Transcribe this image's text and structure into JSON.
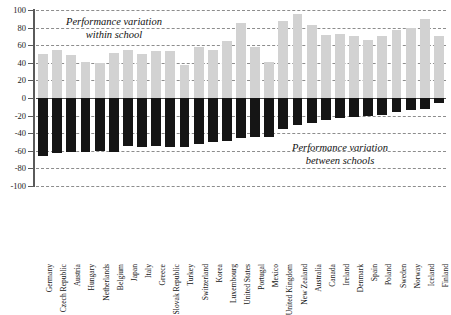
{
  "chart_data": {
    "type": "bar",
    "title": "",
    "subtitle": "",
    "xlabel": "",
    "ylabel": "",
    "ylim": [
      -100,
      100
    ],
    "yticks": [
      100,
      80,
      60,
      40,
      20,
      0,
      -20,
      -40,
      -60,
      -80,
      -100
    ],
    "ytick_labels": [
      "100",
      "80",
      "60",
      "40",
      "20",
      "0",
      "-20",
      "-40",
      "-60",
      "-80",
      "-100"
    ],
    "grid": true,
    "legend_position": "none",
    "stacked": true,
    "annotations": [
      {
        "id": "within",
        "text_line1": "Performance variation",
        "text_line2": "within school"
      },
      {
        "id": "between",
        "text_line1": "Performance variation",
        "text_line2": "between schools"
      }
    ],
    "series": [
      {
        "name": "Performance variation within school",
        "color": "#d2d2d2",
        "values": [
          50,
          55,
          49,
          41,
          40,
          51,
          55,
          50,
          53,
          53,
          38,
          58,
          55,
          65,
          85,
          58,
          41,
          88,
          95,
          83,
          72,
          73,
          70,
          66,
          71,
          77,
          80,
          90,
          70
        ]
      },
      {
        "name": "Performance variation between schools",
        "color": "#151515",
        "values": [
          -66,
          -63,
          -61,
          -61,
          -60,
          -61,
          -55,
          -56,
          -55,
          -56,
          -56,
          -52,
          -50,
          -49,
          -45,
          -44,
          -44,
          -35,
          -31,
          -28,
          -25,
          -23,
          -22,
          -21,
          -19,
          -16,
          -14,
          -12,
          -6
        ]
      }
    ],
    "categories": [
      "Germany",
      "Czech Republic",
      "Austria",
      "Hungary",
      "Netherlands",
      "Belgium",
      "Japan",
      "Italy",
      "Greece",
      "Slovak Republic",
      "Turkey",
      "Switzerland",
      "Korea",
      "Luxembourg",
      "United States",
      "Portugal",
      "Mexico",
      "United Kingdom",
      "New Zealand",
      "Australia",
      "Canada",
      "Ireland",
      "Denmark",
      "Spain",
      "Poland",
      "Sweden",
      "Norway",
      "Iceland",
      "Finland"
    ]
  },
  "colors": {
    "positive_bar": "#d2d2d2",
    "negative_bar": "#151515",
    "axis": "#5a5a5a",
    "gridline": "#8d8d8d",
    "text": "#131313",
    "background": "#ffffff"
  }
}
